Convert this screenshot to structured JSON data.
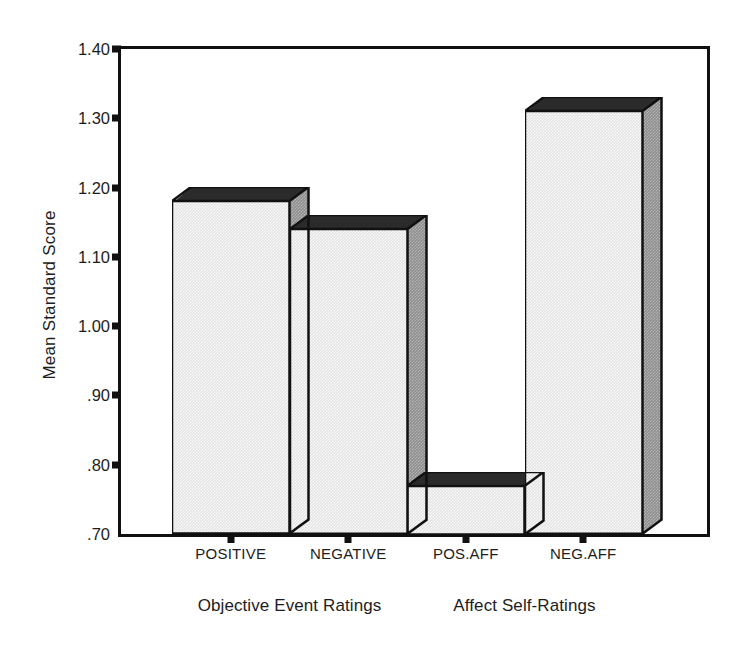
{
  "chart_data": {
    "type": "bar",
    "title": "",
    "subtitle": "",
    "xlabel": "",
    "ylabel": "Mean Standard Score",
    "categories": [
      "POSITIVE",
      "NEGATIVE",
      "POS.AFF",
      "NEG.AFF"
    ],
    "values": [
      1.18,
      1.14,
      0.77,
      1.31
    ],
    "ylim": [
      0.7,
      1.4
    ],
    "yticks": [
      0.7,
      0.8,
      0.9,
      1.0,
      1.1,
      1.2,
      1.3,
      1.4
    ],
    "ytick_labels": [
      ".70",
      ".80",
      ".90",
      "1.00",
      "1.10",
      "1.20",
      "1.30",
      "1.40"
    ],
    "grid": false,
    "legend": false,
    "legend_position": "none",
    "style": "3d-bar",
    "groups": [
      {
        "label": "Objective Event Ratings",
        "categories": [
          "POSITIVE",
          "NEGATIVE"
        ]
      },
      {
        "label": "Affect Self-Ratings",
        "categories": [
          "POS.AFF",
          "NEG.AFF"
        ]
      }
    ],
    "colors": {
      "bar_front": "#e3e3e3",
      "bar_side": "#8d8d8d",
      "bar_top": "#2b2b2b",
      "outline": "#111111",
      "background": "#ffffff",
      "text": "#1d1d1d"
    }
  }
}
